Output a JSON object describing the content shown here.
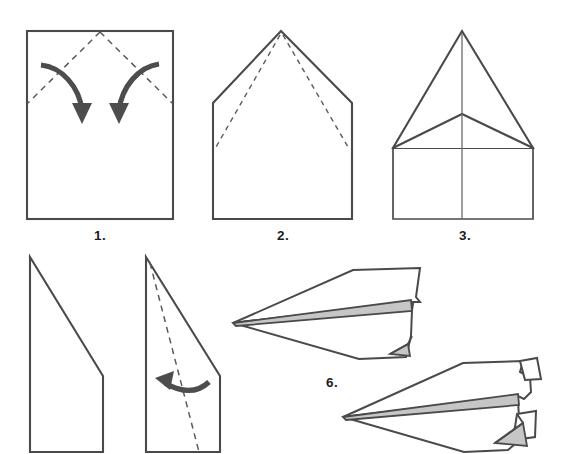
{
  "document": {
    "title": "Paper Airplane Folding Instructions",
    "background_color": "#ffffff",
    "width": 561,
    "height": 454
  },
  "palette": {
    "paper_outline": "#4a4a4a",
    "crease_dash": "#5a5a5a",
    "arrow": "#4d4d4d",
    "shade_gray": "#c6c6c6",
    "label_text": "#1d1d1d",
    "paper_fill": "#ffffff"
  },
  "steps": [
    {
      "id": "step-1",
      "label": "1.",
      "label_x": 100,
      "label_y": 240,
      "description": "Rectangular sheet of paper with dashed diagonal crease lines from the top center to the left and right edges, and two curved arrows showing the top corners folding inward and down."
    },
    {
      "id": "step-2",
      "label": "2.",
      "label_x": 283,
      "label_y": 240,
      "description": "Pentagon house shape after the top corners are folded to the center, with dashed crease lines running from the peak down toward the shoulders."
    },
    {
      "id": "step-3",
      "label": "3.",
      "label_x": 465,
      "label_y": 240,
      "description": "Folded shape with a tall triangular nose, an inverted V crease below the peak, a vertical center crease and a rectangular body."
    },
    {
      "id": "step-4",
      "label": "",
      "label_x": 0,
      "label_y": 0,
      "description": "Side view after folding in half: a quadrilateral with a vertical left spine, a long diagonal top edge and a short vertical right edge."
    },
    {
      "id": "step-5",
      "label": "",
      "label_x": 0,
      "label_y": 0,
      "description": "Same side view with a dashed crease running from the top spine down to the bottom edge and a curved arrow pointing left, showing the wing being folded down."
    },
    {
      "id": "step-6",
      "label": "6.",
      "label_x": 332,
      "label_y": 387,
      "description": "Finished dart-style paper airplane seen from the side, with a shaded gray fuselage ridge and a small gray triangular fin at the tail."
    },
    {
      "id": "step-7",
      "label": "",
      "label_x": 0,
      "label_y": 0,
      "description": "Completed paper airplane with the wing tips folded up into winglets at the tail, shown with shaded gray fuselage ridge and shaded tail flap."
    }
  ]
}
